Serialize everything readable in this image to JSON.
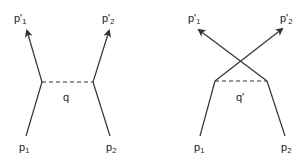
{
  "diagrams": [
    {
      "name": "direct-exchange",
      "labels": {
        "out1": "p'",
        "out1_sub": "1",
        "out2": "p'",
        "out2_sub": "2",
        "in1": "p",
        "in1_sub": "1",
        "in2": "p",
        "in2_sub": "2",
        "propagator": "q"
      }
    },
    {
      "name": "crossed-exchange",
      "labels": {
        "out1": "p'",
        "out1_sub": "1",
        "out2": "p'",
        "out2_sub": "2",
        "in1": "p",
        "in1_sub": "1",
        "in2": "p",
        "in2_sub": "2",
        "propagator": "q'"
      }
    }
  ],
  "colors": {
    "line": "#333333",
    "text": "#222222"
  }
}
